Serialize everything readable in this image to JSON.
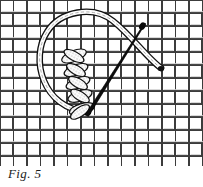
{
  "figure": {
    "caption": "Fig. 5",
    "canvas": {
      "width": 203,
      "height": 187
    },
    "plate": {
      "x": 0,
      "y": 0,
      "width": 203,
      "height": 166
    }
  },
  "colors": {
    "background": "#ffffff",
    "ink": "#1a1a1a",
    "weave_line": "#3c3c3c",
    "weave_fill": "#ffffff",
    "weave_shadow": "#d8d8d8",
    "thread_outline": "#111111",
    "thread_fill": "#fdfdfd",
    "needle": "#0a0a0a",
    "stitch_stipple": "#7a7a7a",
    "caption_text": "#1a1a1a"
  },
  "fabric": {
    "name": "basket-weave-ground",
    "pattern": "plain-weave-blocks",
    "cell_width": 13.5,
    "cell_height": 13,
    "columns": 15,
    "rows": 13,
    "stroke_width": 1.3
  },
  "thread": {
    "name": "working-thread-loop",
    "band_width": 4.2,
    "outline_width": 1.1,
    "loop_path": "M 88 112 C 44 108, 33 60, 48 33 C 60 12, 92 6, 112 22 C 130 36, 146 58, 160 68",
    "tail_end": {
      "x": 161,
      "y": 69
    },
    "anchor_start": {
      "x": 88,
      "y": 112
    }
  },
  "needle": {
    "name": "sewing-needle",
    "eye_end": {
      "x": 143,
      "y": 26
    },
    "tip_end": {
      "x": 86,
      "y": 114
    },
    "shaft_width_eye": 5.6,
    "shaft_width_tip": 1.2
  },
  "stitch_column": {
    "name": "braid-stitch-column",
    "count": 5,
    "top": {
      "x": 74,
      "y": 52
    },
    "bottom": {
      "x": 86,
      "y": 113
    },
    "units": [
      {
        "cx": 74,
        "cy": 56,
        "angle": -22,
        "w": 26,
        "h": 11
      },
      {
        "cx": 76,
        "cy": 70,
        "angle": -20,
        "w": 25,
        "h": 11
      },
      {
        "cx": 78,
        "cy": 83,
        "angle": -20,
        "w": 25,
        "h": 11
      },
      {
        "cx": 80,
        "cy": 96,
        "angle": -18,
        "w": 25,
        "h": 11
      },
      {
        "cx": 82,
        "cy": 109,
        "angle": -16,
        "w": 26,
        "h": 11
      }
    ]
  }
}
